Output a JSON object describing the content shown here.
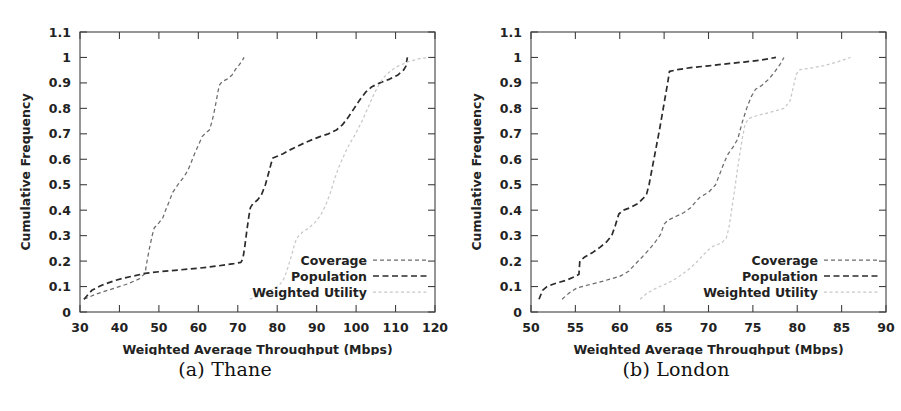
{
  "figure": {
    "panels": [
      {
        "id": "a",
        "caption": "(a) Thane",
        "xlabel": "Weighted Average Throughput (Mbps)",
        "ylabel": "Cumulative Frequency",
        "xticks": [
          "30",
          "40",
          "50",
          "60",
          "70",
          "80",
          "90",
          "100",
          "110",
          "120"
        ],
        "yticks": [
          "0",
          "0.1",
          "0.2",
          "0.3",
          "0.4",
          "0.5",
          "0.6",
          "0.7",
          "0.8",
          "0.9",
          "1",
          "1.1"
        ],
        "legend": [
          {
            "label": "Coverage",
            "key": "coverage"
          },
          {
            "label": "Population",
            "key": "population"
          },
          {
            "label": "Weighted Utility",
            "key": "weighted_utility"
          }
        ]
      },
      {
        "id": "b",
        "caption": "(b) London",
        "xlabel": "Weighted Average Throughput (Mbps)",
        "ylabel": "Cumulative Frequency",
        "xticks": [
          "50",
          "55",
          "60",
          "65",
          "70",
          "75",
          "80",
          "85",
          "90"
        ],
        "yticks": [
          "0",
          "0.1",
          "0.2",
          "0.3",
          "0.4",
          "0.5",
          "0.6",
          "0.7",
          "0.8",
          "0.9",
          "1",
          "1.1"
        ],
        "legend": [
          {
            "label": "Coverage",
            "key": "coverage"
          },
          {
            "label": "Population",
            "key": "population"
          },
          {
            "label": "Weighted Utility",
            "key": "weighted_utility"
          }
        ]
      }
    ]
  },
  "style": {
    "coverage_color": "#6b6b6b",
    "population_color": "#2b2b2b",
    "weighted_utility_color": "#c8c8c8",
    "frame_color": "#404040",
    "background": "#ffffff"
  },
  "chart_data": [
    {
      "type": "line",
      "title": "(a) Thane",
      "xlabel": "Weighted Average Throughput (Mbps)",
      "ylabel": "Cumulative Frequency",
      "xlim": [
        30,
        120
      ],
      "ylim": [
        0,
        1.1
      ],
      "xticks": [
        30,
        40,
        50,
        60,
        70,
        80,
        90,
        100,
        110,
        120
      ],
      "yticks": [
        0,
        0.1,
        0.2,
        0.3,
        0.4,
        0.5,
        0.6,
        0.7,
        0.8,
        0.9,
        1,
        1.1
      ],
      "grid": false,
      "legend_position": "lower right",
      "series": [
        {
          "name": "Coverage",
          "linestyle": "fine-dash",
          "color": "#6b6b6b",
          "points": [
            [
              31.0,
              0.05
            ],
            [
              34.0,
              0.07
            ],
            [
              38.0,
              0.09
            ],
            [
              42.0,
              0.11
            ],
            [
              45.0,
              0.13
            ],
            [
              46.5,
              0.152
            ],
            [
              47.0,
              0.2
            ],
            [
              47.6,
              0.25
            ],
            [
              48.3,
              0.3
            ],
            [
              48.8,
              0.33
            ],
            [
              50.0,
              0.35
            ],
            [
              51.0,
              0.37
            ],
            [
              51.7,
              0.4
            ],
            [
              52.5,
              0.43
            ],
            [
              53.5,
              0.47
            ],
            [
              54.8,
              0.5
            ],
            [
              56.3,
              0.53
            ],
            [
              57.3,
              0.555
            ],
            [
              58.0,
              0.58
            ],
            [
              59.0,
              0.62
            ],
            [
              60.0,
              0.655
            ],
            [
              61.0,
              0.69
            ],
            [
              62.0,
              0.705
            ],
            [
              62.8,
              0.715
            ],
            [
              63.5,
              0.75
            ],
            [
              64.2,
              0.8
            ],
            [
              64.8,
              0.85
            ],
            [
              65.3,
              0.89
            ],
            [
              66.0,
              0.905
            ],
            [
              67.3,
              0.915
            ],
            [
              68.5,
              0.93
            ],
            [
              69.5,
              0.955
            ],
            [
              70.3,
              0.97
            ],
            [
              71.0,
              0.985
            ],
            [
              71.6,
              1.0
            ]
          ]
        },
        {
          "name": "Population",
          "linestyle": "dash",
          "color": "#2b2b2b",
          "points": [
            [
              31.0,
              0.05
            ],
            [
              33.0,
              0.085
            ],
            [
              35.5,
              0.105
            ],
            [
              38.5,
              0.122
            ],
            [
              41.0,
              0.133
            ],
            [
              44.0,
              0.143
            ],
            [
              46.5,
              0.152
            ],
            [
              50.0,
              0.158
            ],
            [
              55.0,
              0.165
            ],
            [
              60.0,
              0.172
            ],
            [
              65.0,
              0.181
            ],
            [
              69.0,
              0.19
            ],
            [
              70.8,
              0.195
            ],
            [
              71.3,
              0.21
            ],
            [
              71.8,
              0.26
            ],
            [
              72.3,
              0.32
            ],
            [
              72.8,
              0.375
            ],
            [
              73.2,
              0.41
            ],
            [
              73.8,
              0.425
            ],
            [
              75.0,
              0.44
            ],
            [
              76.0,
              0.46
            ],
            [
              77.0,
              0.5
            ],
            [
              77.8,
              0.545
            ],
            [
              78.4,
              0.58
            ],
            [
              78.9,
              0.605
            ],
            [
              80.0,
              0.612
            ],
            [
              81.5,
              0.622
            ],
            [
              83.0,
              0.635
            ],
            [
              85.0,
              0.65
            ],
            [
              87.0,
              0.665
            ],
            [
              89.0,
              0.678
            ],
            [
              91.0,
              0.69
            ],
            [
              93.0,
              0.7
            ],
            [
              95.0,
              0.715
            ],
            [
              96.5,
              0.735
            ],
            [
              98.0,
              0.765
            ],
            [
              99.5,
              0.8
            ],
            [
              101.0,
              0.835
            ],
            [
              102.5,
              0.865
            ],
            [
              104.0,
              0.885
            ],
            [
              106.0,
              0.9
            ],
            [
              108.5,
              0.915
            ],
            [
              110.5,
              0.93
            ],
            [
              112.0,
              0.95
            ],
            [
              112.6,
              0.965
            ],
            [
              113.0,
              1.0
            ]
          ]
        },
        {
          "name": "Weighted Utility",
          "linestyle": "dot",
          "color": "#c8c8c8",
          "points": [
            [
              73.0,
              0.05
            ],
            [
              75.0,
              0.06
            ],
            [
              77.0,
              0.075
            ],
            [
              79.0,
              0.09
            ],
            [
              80.5,
              0.105
            ],
            [
              81.5,
              0.125
            ],
            [
              82.3,
              0.155
            ],
            [
              83.0,
              0.19
            ],
            [
              83.6,
              0.22
            ],
            [
              84.2,
              0.255
            ],
            [
              84.8,
              0.285
            ],
            [
              85.5,
              0.3
            ],
            [
              86.5,
              0.315
            ],
            [
              88.0,
              0.33
            ],
            [
              89.5,
              0.35
            ],
            [
              91.0,
              0.38
            ],
            [
              92.3,
              0.42
            ],
            [
              93.5,
              0.47
            ],
            [
              94.5,
              0.52
            ],
            [
              95.5,
              0.565
            ],
            [
              96.5,
              0.6
            ],
            [
              97.5,
              0.635
            ],
            [
              98.5,
              0.665
            ],
            [
              99.5,
              0.69
            ],
            [
              100.5,
              0.72
            ],
            [
              101.5,
              0.75
            ],
            [
              102.5,
              0.785
            ],
            [
              103.5,
              0.82
            ],
            [
              104.5,
              0.855
            ],
            [
              105.5,
              0.885
            ],
            [
              106.5,
              0.91
            ],
            [
              107.5,
              0.93
            ],
            [
              109.0,
              0.95
            ],
            [
              110.5,
              0.965
            ],
            [
              112.0,
              0.975
            ],
            [
              113.5,
              0.985
            ],
            [
              116.0,
              0.995
            ],
            [
              118.5,
              1.0
            ]
          ]
        }
      ]
    },
    {
      "type": "line",
      "title": "(b) London",
      "xlabel": "Weighted Average Throughput (Mbps)",
      "ylabel": "Cumulative Frequency",
      "xlim": [
        50,
        90
      ],
      "ylim": [
        0,
        1.1
      ],
      "xticks": [
        50,
        55,
        60,
        65,
        70,
        75,
        80,
        85,
        90
      ],
      "yticks": [
        0,
        0.1,
        0.2,
        0.3,
        0.4,
        0.5,
        0.6,
        0.7,
        0.8,
        0.9,
        1,
        1.1
      ],
      "grid": false,
      "legend_position": "lower right",
      "series": [
        {
          "name": "Coverage",
          "linestyle": "fine-dash",
          "color": "#6b6b6b",
          "points": [
            [
              53.5,
              0.05
            ],
            [
              54.3,
              0.075
            ],
            [
              55.2,
              0.095
            ],
            [
              56.3,
              0.105
            ],
            [
              57.5,
              0.115
            ],
            [
              58.8,
              0.128
            ],
            [
              60.0,
              0.14
            ],
            [
              61.0,
              0.16
            ],
            [
              61.8,
              0.19
            ],
            [
              62.5,
              0.215
            ],
            [
              63.3,
              0.245
            ],
            [
              64.0,
              0.275
            ],
            [
              64.6,
              0.305
            ],
            [
              65.0,
              0.345
            ],
            [
              65.4,
              0.36
            ],
            [
              66.3,
              0.375
            ],
            [
              67.2,
              0.39
            ],
            [
              68.0,
              0.41
            ],
            [
              68.6,
              0.435
            ],
            [
              69.0,
              0.45
            ],
            [
              70.0,
              0.47
            ],
            [
              70.8,
              0.5
            ],
            [
              71.3,
              0.545
            ],
            [
              71.8,
              0.59
            ],
            [
              72.2,
              0.62
            ],
            [
              72.8,
              0.65
            ],
            [
              73.3,
              0.68
            ],
            [
              73.8,
              0.745
            ],
            [
              74.3,
              0.8
            ],
            [
              74.8,
              0.845
            ],
            [
              75.3,
              0.875
            ],
            [
              76.0,
              0.89
            ],
            [
              76.8,
              0.915
            ],
            [
              77.5,
              0.945
            ],
            [
              78.1,
              0.975
            ],
            [
              78.5,
              1.0
            ]
          ]
        },
        {
          "name": "Population",
          "linestyle": "dash",
          "color": "#2b2b2b",
          "points": [
            [
              50.9,
              0.05
            ],
            [
              51.3,
              0.085
            ],
            [
              51.8,
              0.1
            ],
            [
              52.8,
              0.113
            ],
            [
              54.0,
              0.125
            ],
            [
              55.0,
              0.14
            ],
            [
              55.4,
              0.148
            ],
            [
              55.5,
              0.2
            ],
            [
              56.0,
              0.215
            ],
            [
              57.0,
              0.235
            ],
            [
              57.8,
              0.255
            ],
            [
              58.5,
              0.275
            ],
            [
              59.1,
              0.3
            ],
            [
              59.5,
              0.34
            ],
            [
              59.9,
              0.385
            ],
            [
              60.4,
              0.4
            ],
            [
              61.2,
              0.41
            ],
            [
              62.0,
              0.425
            ],
            [
              62.6,
              0.445
            ],
            [
              63.0,
              0.46
            ],
            [
              63.3,
              0.5
            ],
            [
              63.6,
              0.555
            ],
            [
              63.9,
              0.61
            ],
            [
              64.2,
              0.665
            ],
            [
              64.5,
              0.72
            ],
            [
              64.8,
              0.78
            ],
            [
              65.1,
              0.84
            ],
            [
              65.4,
              0.9
            ],
            [
              65.6,
              0.945
            ],
            [
              66.5,
              0.952
            ],
            [
              68.0,
              0.96
            ],
            [
              70.0,
              0.967
            ],
            [
              72.0,
              0.975
            ],
            [
              74.0,
              0.982
            ],
            [
              76.0,
              0.99
            ],
            [
              77.6,
              1.0
            ]
          ]
        },
        {
          "name": "Weighted Utility",
          "linestyle": "dot",
          "color": "#c8c8c8",
          "points": [
            [
              62.3,
              0.05
            ],
            [
              63.0,
              0.072
            ],
            [
              63.8,
              0.088
            ],
            [
              64.5,
              0.1
            ],
            [
              65.5,
              0.115
            ],
            [
              66.5,
              0.135
            ],
            [
              67.5,
              0.16
            ],
            [
              68.5,
              0.19
            ],
            [
              69.3,
              0.22
            ],
            [
              70.0,
              0.245
            ],
            [
              70.5,
              0.258
            ],
            [
              71.5,
              0.272
            ],
            [
              72.0,
              0.29
            ],
            [
              72.3,
              0.33
            ],
            [
              72.6,
              0.4
            ],
            [
              72.9,
              0.47
            ],
            [
              73.2,
              0.545
            ],
            [
              73.5,
              0.615
            ],
            [
              73.8,
              0.68
            ],
            [
              74.1,
              0.735
            ],
            [
              74.5,
              0.76
            ],
            [
              75.5,
              0.772
            ],
            [
              77.0,
              0.785
            ],
            [
              78.5,
              0.8
            ],
            [
              79.2,
              0.83
            ],
            [
              79.6,
              0.89
            ],
            [
              79.9,
              0.935
            ],
            [
              80.3,
              0.952
            ],
            [
              81.5,
              0.958
            ],
            [
              83.0,
              0.968
            ],
            [
              84.5,
              0.982
            ],
            [
              86.0,
              1.0
            ]
          ]
        }
      ]
    }
  ]
}
